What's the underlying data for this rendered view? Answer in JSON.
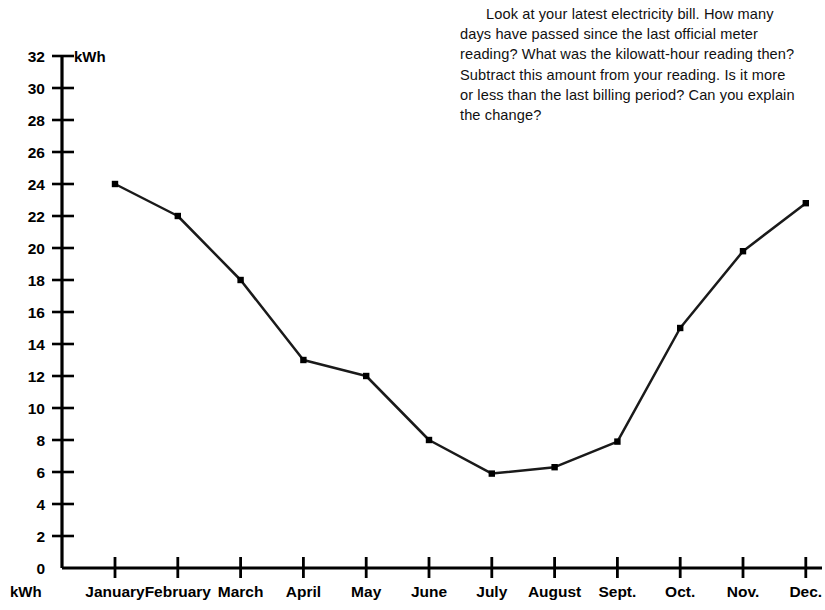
{
  "note": {
    "text": "Look at your latest electricity bill. How many days have passed since the last official meter reading? What was the kilowatt-hour reading then? Subtract this amount from your reading. Is it more or less than the last billing period? Can you explain the change?"
  },
  "axis": {
    "y_unit_top": "kWh",
    "y_unit_bottom": "kWh"
  },
  "chart_data": {
    "type": "line",
    "title": "",
    "xlabel": "",
    "ylabel": "kWh",
    "ylim": [
      0,
      32
    ],
    "ytick_step": 2,
    "yticks": [
      0,
      2,
      4,
      6,
      8,
      10,
      12,
      14,
      16,
      18,
      20,
      22,
      24,
      26,
      28,
      30,
      32
    ],
    "ytick_labels": [
      "0",
      "2",
      "4",
      "6",
      "8",
      "10",
      "12",
      "14",
      "16",
      "18",
      "20",
      "22",
      "24",
      "26",
      "28",
      "30",
      "32"
    ],
    "grid": false,
    "legend": false,
    "marker": "square",
    "line_color": "#1a1a1a",
    "marker_color": "#000000",
    "categories": [
      "January",
      "February",
      "March",
      "April",
      "May",
      "June",
      "July",
      "August",
      "Sept.",
      "Oct.",
      "Nov.",
      "Dec."
    ],
    "values": [
      24.0,
      22.0,
      18.0,
      13.0,
      12.0,
      8.0,
      5.9,
      6.3,
      7.9,
      15.0,
      19.8,
      22.8
    ]
  }
}
